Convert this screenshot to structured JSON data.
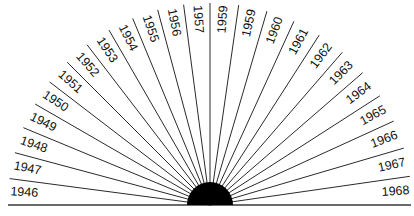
{
  "diagram": {
    "type": "radial-fan",
    "center": {
      "x": 210,
      "y": 205
    },
    "hub_radius": 23,
    "ray_length": 202,
    "colors": {
      "line": "#2a2a2a",
      "hub": "#000000",
      "text": "#111111",
      "background": "#ffffff"
    },
    "left_labels": [
      "1946",
      "1947",
      "1948",
      "1949",
      "1950",
      "1951",
      "1952",
      "1953",
      "1954",
      "1955",
      "1956",
      "1957"
    ],
    "right_labels": [
      "1959",
      "1959",
      "1960",
      "1961",
      "1962",
      "1963",
      "1964",
      "1965",
      "1966",
      "1967",
      "1968"
    ]
  }
}
